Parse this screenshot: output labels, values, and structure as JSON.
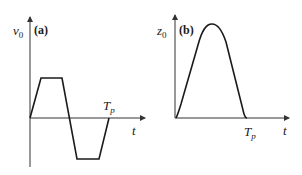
{
  "panels": [
    {
      "id": "a",
      "tag": "(a)",
      "y_label": "v",
      "y_label_sub": "0",
      "x_label": "t",
      "period_label": "T",
      "period_label_sub": "p",
      "shape": "trapezoidal velocity pulse (positive then negative)",
      "points": [
        [
          30,
          118
        ],
        [
          41,
          78
        ],
        [
          62,
          78
        ],
        [
          77,
          159
        ],
        [
          99,
          159
        ],
        [
          109,
          118
        ]
      ]
    },
    {
      "id": "b",
      "tag": "(b)",
      "y_label": "z",
      "y_label_sub": "0",
      "x_label": "t",
      "period_label": "T",
      "period_label_sub": "p",
      "shape": "single rounded displacement hump"
    }
  ],
  "colors": {
    "line": "#1a1a1a",
    "axis": "#333333",
    "background": "#ffffff"
  }
}
